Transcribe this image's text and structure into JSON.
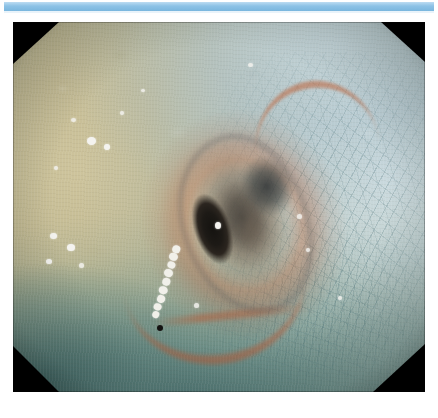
{
  "page": {
    "background_color": "#ffffff",
    "width": 438,
    "height": 418
  },
  "header_bar": {
    "name": "top-accent-bar",
    "color": "#8cc2e6",
    "label": ""
  },
  "figure": {
    "caption": "",
    "alt": "Endoscopic photograph of gastric mucosa showing an ulcerated lesion",
    "modality": "chromoendoscopy",
    "frame_corner_color": "#000000",
    "regions": [
      {
        "name": "tan-olive-mucosa-left",
        "color": "#c4bd99"
      },
      {
        "name": "pale-blue-dyed-mucosa-right",
        "color": "#c4d8e0"
      },
      {
        "name": "teal-mucosa-bottom",
        "color": "#4a7474"
      },
      {
        "name": "erythematous-margin",
        "color": "#b85c38"
      },
      {
        "name": "ulcer-crater-dark",
        "color": "#1d1a16"
      },
      {
        "name": "specular-debris",
        "color": "#f4f3ef"
      }
    ]
  }
}
